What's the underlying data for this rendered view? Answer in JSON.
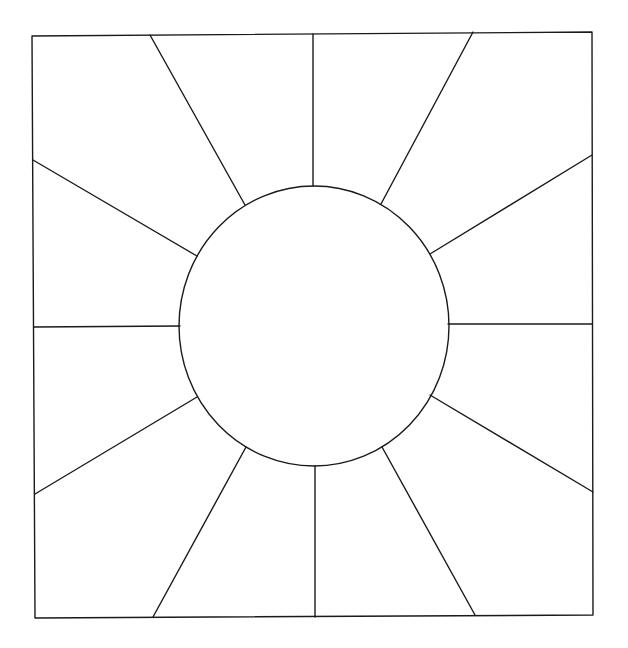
{
  "diagram": {
    "type": "sunburst-quilt-block",
    "colors": {
      "background": "#ffffff",
      "stroke": "#1a1a1a"
    },
    "frame": {
      "points": [
        [
          32,
          36
        ],
        [
          592,
          32
        ],
        [
          593,
          615
        ],
        [
          35,
          618
        ]
      ]
    },
    "center_circle": {
      "cx": 314,
      "cy": 326,
      "rx": 135,
      "ry": 140
    },
    "rays": [
      {
        "x1": 313,
        "y1": 34,
        "x2": 313,
        "y2": 186
      },
      {
        "x1": 150,
        "y1": 35,
        "x2": 245,
        "y2": 205
      },
      {
        "x1": 473,
        "y1": 32,
        "x2": 381,
        "y2": 204
      },
      {
        "x1": 33,
        "y1": 160,
        "x2": 197,
        "y2": 256
      },
      {
        "x1": 592,
        "y1": 155,
        "x2": 430,
        "y2": 254
      },
      {
        "x1": 34,
        "y1": 327,
        "x2": 180,
        "y2": 326
      },
      {
        "x1": 592,
        "y1": 324,
        "x2": 448,
        "y2": 324
      },
      {
        "x1": 35,
        "y1": 494,
        "x2": 197,
        "y2": 397
      },
      {
        "x1": 593,
        "y1": 492,
        "x2": 430,
        "y2": 395
      },
      {
        "x1": 153,
        "y1": 617,
        "x2": 246,
        "y2": 447
      },
      {
        "x1": 475,
        "y1": 615,
        "x2": 382,
        "y2": 447
      },
      {
        "x1": 315,
        "y1": 617,
        "x2": 315,
        "y2": 466
      }
    ],
    "ray_count": 12
  }
}
